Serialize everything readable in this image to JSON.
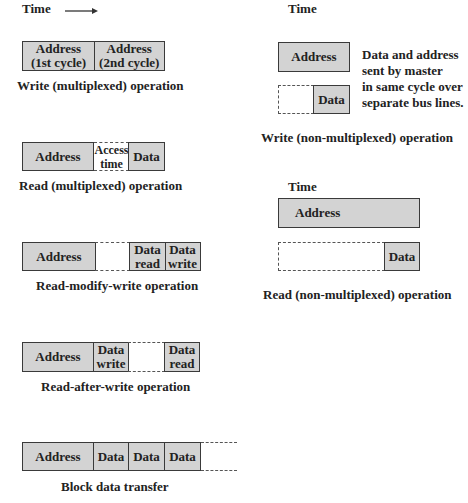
{
  "time_label": "Time",
  "diagrams": {
    "write_mux": {
      "caption": "Write (multiplexed) operation",
      "cells": [
        "Address (1st cycle)",
        "Address (2nd cycle)"
      ],
      "cell1_l1": "Address",
      "cell1_l2": "(1st cycle)",
      "cell2_l1": "Address",
      "cell2_l2": "(2nd cycle)"
    },
    "read_mux": {
      "caption": "Read (multiplexed) operation",
      "address": "Address",
      "access_l1": "Access",
      "access_l2": "time",
      "data": "Data"
    },
    "rmw": {
      "caption": "Read-modify-write operation",
      "address": "Address",
      "read_l1": "Data",
      "read_l2": "read",
      "write_l1": "Data",
      "write_l2": "write"
    },
    "raw": {
      "caption": "Read-after-write operation",
      "address": "Address",
      "write_l1": "Data",
      "write_l2": "write",
      "read_l1": "Data",
      "read_l2": "read"
    },
    "block": {
      "caption": "Block data transfer",
      "address": "Address",
      "data": [
        "Data",
        "Data",
        "Data"
      ]
    },
    "write_nonmux": {
      "caption": "Write (non-multiplexed) operation",
      "address": "Address",
      "data": "Data",
      "note": [
        "Data and address",
        "sent by master",
        "in same cycle over",
        "separate bus lines."
      ]
    },
    "read_nonmux": {
      "caption": "Read (non-multiplexed) operation",
      "address": "Address",
      "data": "Data"
    }
  },
  "colors": {
    "fill": "#d3d3d3",
    "stroke": "#3a3a3a",
    "text": "#222222"
  }
}
